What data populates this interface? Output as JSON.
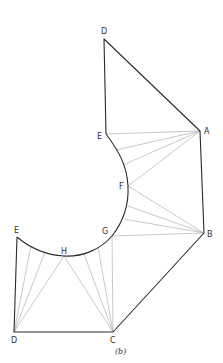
{
  "diagram": {
    "caption": "(b)",
    "colors": {
      "outline": "#2a2a2a",
      "fan": "#b0b0b0",
      "label": "#333333"
    },
    "points": {
      "D_top": {
        "label": "D",
        "x": 104,
        "y": 39
      },
      "A": {
        "label": "A",
        "x": 200,
        "y": 131
      },
      "E_top": {
        "label": "E",
        "x": 106,
        "y": 134
      },
      "F": {
        "label": "F",
        "x": 128,
        "y": 186
      },
      "B": {
        "label": "B",
        "x": 204,
        "y": 233
      },
      "G": {
        "label": "G",
        "x": 112,
        "y": 236
      },
      "H": {
        "label": "H",
        "x": 64,
        "y": 256
      },
      "E_left": {
        "label": "E",
        "x": 17,
        "y": 237
      },
      "D_bottom": {
        "label": "D",
        "x": 14,
        "y": 332
      },
      "C": {
        "label": "C",
        "x": 113,
        "y": 332
      }
    },
    "labels": {
      "D_top": "D",
      "E_top": "E",
      "A": "A",
      "F": "F",
      "B": "B",
      "G": "G",
      "H": "H",
      "E_left": "E",
      "D_bottom": "D",
      "C": "C"
    },
    "outline_edges": [
      [
        "D_top",
        "A"
      ],
      [
        "D_top",
        "E_top"
      ],
      [
        "A",
        "B"
      ],
      [
        "B",
        "C"
      ],
      [
        "C",
        "D_bottom"
      ],
      [
        "D_bottom",
        "E_left"
      ]
    ],
    "fans": [
      {
        "from": "A",
        "to_arc_points": [
          [
            106,
            134
          ],
          [
            116,
            150
          ],
          [
            123,
            165
          ],
          [
            128,
            186
          ]
        ]
      },
      {
        "from": "B",
        "to_arc_points": [
          [
            128,
            186
          ],
          [
            128,
            206
          ],
          [
            124,
            219
          ],
          [
            112,
            236
          ]
        ]
      },
      {
        "from": "C",
        "to_arc_points": [
          [
            112,
            236
          ],
          [
            98,
            247
          ],
          [
            84,
            254
          ],
          [
            64,
            256
          ]
        ]
      },
      {
        "from": "D_bottom",
        "to_arc_points": [
          [
            64,
            256
          ],
          [
            45,
            252
          ],
          [
            31,
            246
          ],
          [
            17,
            237
          ]
        ]
      }
    ]
  }
}
